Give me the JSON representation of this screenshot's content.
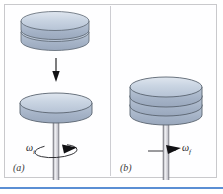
{
  "figure": {
    "title": "",
    "background_color": "#ffffff",
    "frame_color": "#c9c9cc",
    "accent_rule_color": "#5b8fd4"
  },
  "panels": [
    {
      "id": "a",
      "label": "(a)",
      "angular_velocity_symbol": "ω",
      "angular_velocity_subscript": "i",
      "description": "Two stacked disks held above a single rotating disk on a spindle; downward arrow indicates the disks are dropped.",
      "disks_above": 2,
      "disks_on_spindle": 1,
      "drop_arrow": "down-arrow"
    },
    {
      "id": "b",
      "label": "(b)",
      "angular_velocity_symbol": "ω",
      "angular_velocity_subscript": "f",
      "description": "Three disks now stacked together on the spindle rotating at the final angular velocity.",
      "disks_above": 0,
      "disks_on_spindle": 3,
      "drop_arrow": null
    }
  ],
  "colors": {
    "disk_top_face": "#c3cfdf",
    "disk_top_face_highlight": "#dde5ef",
    "disk_side": "#a8b6c9",
    "disk_outline": "#5a6470",
    "spindle": "#e9e9ec",
    "spindle_outline": "#6e6e76",
    "arrow": "#111114",
    "rotation_arc": "#222226"
  }
}
